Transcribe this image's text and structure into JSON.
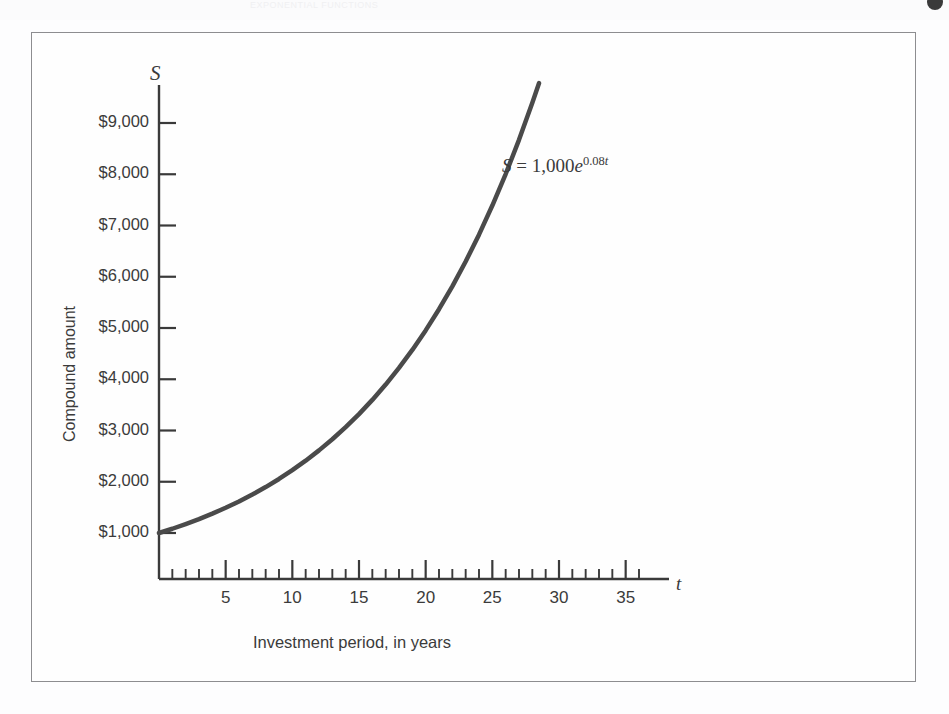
{
  "page": {
    "header_title": "EXPONENTIAL FUNCTIONS",
    "corner_mark": "page-corner-dot"
  },
  "figure": {
    "y_axis_symbol": "S",
    "x_axis_symbol": "t",
    "y_axis_title": "Compound amount",
    "x_axis_title": "Investment period, in years",
    "equation": {
      "lhs": "S",
      "eq": " = ",
      "coefficient": "1,000",
      "base": "e",
      "exponent_rate": "0.08",
      "exponent_var": "t",
      "full": "S = 1,000e^0.08t"
    },
    "colors": {
      "curve": "#4a4a4a",
      "axis": "#3a3a3a",
      "frame": "#8d8d90",
      "text": "#3b3b3b",
      "background": "#fefefe"
    }
  },
  "chart_data": {
    "type": "line",
    "title": "",
    "subtitle": "",
    "xlabel": "Investment period, in years",
    "ylabel": "Compound amount",
    "xlim": [
      0,
      37
    ],
    "ylim": [
      0,
      9800
    ],
    "grid": false,
    "legend": null,
    "annotations": [
      {
        "text": "S = 1,000e^0.08t",
        "x": 26,
        "y": 8200
      }
    ],
    "x_ticks_major": [
      5,
      10,
      15,
      20,
      25,
      30,
      35
    ],
    "x_tick_labels": [
      "5",
      "10",
      "15",
      "20",
      "25",
      "30",
      "35"
    ],
    "x_ticks_minor_step": 1,
    "y_ticks": [
      1000,
      2000,
      3000,
      4000,
      5000,
      6000,
      7000,
      8000,
      9000
    ],
    "y_tick_labels": [
      "$1,000",
      "$2,000",
      "$3,000",
      "$4,000",
      "$5,000",
      "$6,000",
      "$7,000",
      "$8,000",
      "$9,000"
    ],
    "series": [
      {
        "name": "S = 1,000e^0.08t",
        "formula": "S = 1000 * exp(0.08 * t)",
        "x": [
          0,
          1,
          2,
          3,
          4,
          5,
          6,
          7,
          8,
          9,
          10,
          11,
          12,
          13,
          14,
          15,
          16,
          17,
          18,
          19,
          20,
          21,
          22,
          23,
          24,
          25,
          26,
          27,
          28,
          28.5
        ],
        "values": [
          1000,
          1083,
          1174,
          1271,
          1377,
          1492,
          1616,
          1751,
          1896,
          2054,
          2226,
          2411,
          2612,
          2829,
          3065,
          3320,
          3597,
          3896,
          4221,
          4572,
          4953,
          5366,
          5812,
          6297,
          6821,
          7389,
          8004,
          8671,
          9393,
          9777
        ]
      }
    ]
  }
}
